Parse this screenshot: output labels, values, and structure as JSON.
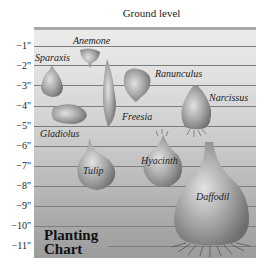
{
  "header": {
    "ground_label": "Ground level"
  },
  "axis": {
    "ticks": [
      "−1\"",
      "−2\"",
      "−3\"",
      "−4\"",
      "−5\"",
      "−6\"",
      "−7\"",
      "−8\"",
      "−9\"",
      "−10\"",
      "−11\""
    ]
  },
  "bulbs": [
    {
      "name": "Anemone",
      "depth_inches": 2
    },
    {
      "name": "Sparaxis",
      "depth_inches": 3
    },
    {
      "name": "Ranunculus",
      "depth_inches": 3
    },
    {
      "name": "Freesia",
      "depth_inches": 5
    },
    {
      "name": "Gladiolus",
      "depth_inches": 5
    },
    {
      "name": "Narcissus",
      "depth_inches": 6
    },
    {
      "name": "Tulip",
      "depth_inches": 8
    },
    {
      "name": "Hyacinth",
      "depth_inches": 8
    },
    {
      "name": "Daffodil",
      "depth_inches": 11
    }
  ],
  "chart_title": {
    "line1": "Planting",
    "line2": "Chart"
  },
  "colors": {
    "bulb_light": "#d8d8d8",
    "bulb_dark": "#7a7a7a",
    "line": "#7d7d7d",
    "panel_top": "#ececec",
    "panel_bottom": "#9c9c9c"
  }
}
